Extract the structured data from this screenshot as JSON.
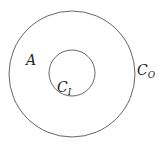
{
  "diagram": {
    "outer_circle": {
      "label": "C",
      "subscript": "O",
      "cx": 72,
      "cy": 74,
      "r": 63
    },
    "inner_circle": {
      "label": "C",
      "subscript": "I",
      "cx": 72,
      "cy": 74,
      "r": 23
    },
    "region_label": "A",
    "stroke_color": "#555555"
  }
}
